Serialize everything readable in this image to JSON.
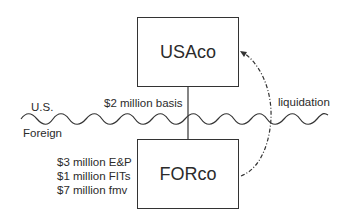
{
  "diagram": {
    "entities": {
      "parent": {
        "label": "USAco"
      },
      "subsidiary": {
        "label": "FORco"
      }
    },
    "border_labels": {
      "top": "U.S.",
      "bottom": "Foreign"
    },
    "ownership_link": {
      "label": "$2 million basis"
    },
    "subsidiary_attributes": [
      "$3 million E&P",
      "$1 million FITs",
      "$7 million fmv"
    ],
    "flow": {
      "label": "liquidation",
      "from": "FORco",
      "to": "USAco",
      "style": "dash-dot"
    },
    "colors": {
      "line": "#333333",
      "text": "#2b2b2b",
      "background": "#ffffff"
    }
  }
}
